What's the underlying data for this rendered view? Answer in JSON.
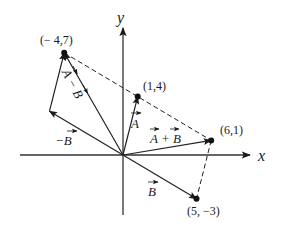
{
  "diagram": {
    "type": "vector-addition-subtraction",
    "axes": {
      "x_label": "x",
      "y_label": "y"
    },
    "points": [
      {
        "id": "P1",
        "x": -4,
        "y": 7,
        "label": "(− 4,7)"
      },
      {
        "id": "P2",
        "x": 1,
        "y": 4,
        "label": "(1,4)"
      },
      {
        "id": "P3",
        "x": 6,
        "y": 1,
        "label": "(6,1)"
      },
      {
        "id": "P4",
        "x": 5,
        "y": -3,
        "label": "(5, −3)"
      }
    ],
    "vectors": [
      {
        "name": "vector-a",
        "from": [
          0,
          0
        ],
        "to": [
          1,
          4
        ],
        "label": "A",
        "prefix": "",
        "suffix": ""
      },
      {
        "name": "vector-b",
        "from": [
          0,
          0
        ],
        "to": [
          5,
          -3
        ],
        "label": "B",
        "prefix": "",
        "suffix": ""
      },
      {
        "name": "vector-a-plus-b",
        "from": [
          0,
          0
        ],
        "to": [
          6,
          1
        ],
        "label": "A+B"
      },
      {
        "name": "vector-neg-b",
        "from": [
          0,
          0
        ],
        "to": [
          -5,
          3
        ],
        "label": "−B"
      },
      {
        "name": "vector-a-minus-b",
        "from": [
          0,
          0
        ],
        "to": [
          -4,
          7
        ],
        "label": "A−B"
      },
      {
        "name": "vector-a-translated",
        "from": [
          -5,
          3
        ],
        "to": [
          -4,
          7
        ],
        "label": ""
      }
    ],
    "dashed_lines": [
      {
        "name": "dashed-p1-p3",
        "from": [
          -4,
          7
        ],
        "to": [
          6,
          1
        ]
      },
      {
        "name": "dashed-p3-p4",
        "from": [
          6,
          1
        ],
        "to": [
          5,
          -3
        ]
      }
    ],
    "labels": {
      "a": "A",
      "b": "B",
      "a_plus_b": "A + B",
      "neg_b": "−B",
      "a_minus_b": "A − B"
    }
  }
}
